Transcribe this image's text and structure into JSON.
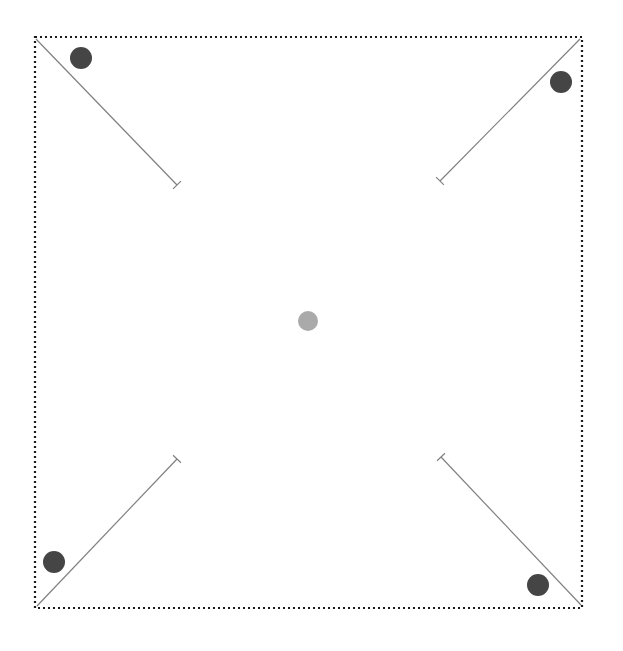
{
  "canvas": {
    "width": 623,
    "height": 651,
    "background": "#ffffff"
  },
  "boundary": {
    "name": "dotted-boundary-rectangle",
    "x": 35,
    "y": 37,
    "width": 547,
    "height": 571,
    "stroke": "#1a1a1a",
    "stroke_width": 2.2,
    "dash": "2 3",
    "style": "dotted"
  },
  "center_marker": {
    "name": "center-node",
    "cx": 308,
    "cy": 321,
    "r": 10,
    "fill": "#aaaaaa"
  },
  "corner_vectors": [
    {
      "name": "vector-top-left",
      "corner": "top-left",
      "x1": 36,
      "y1": 39,
      "x2": 177,
      "y2": 185,
      "stroke": "#808080",
      "stroke_width": 1.2,
      "cap": "perpendicular-tick",
      "cap_length": 11
    },
    {
      "name": "vector-top-right",
      "corner": "top-right",
      "x1": 580,
      "y1": 39,
      "x2": 440,
      "y2": 181,
      "stroke": "#808080",
      "stroke_width": 1.2,
      "cap": "perpendicular-tick",
      "cap_length": 11
    },
    {
      "name": "vector-bottom-left",
      "corner": "bottom-left",
      "x1": 37,
      "y1": 606,
      "x2": 177,
      "y2": 459,
      "stroke": "#808080",
      "stroke_width": 1.2,
      "cap": "perpendicular-tick",
      "cap_length": 11
    },
    {
      "name": "vector-bottom-right",
      "corner": "bottom-right",
      "x1": 581,
      "y1": 605,
      "x2": 441,
      "y2": 457,
      "stroke": "#808080",
      "stroke_width": 1.2,
      "cap": "perpendicular-tick",
      "cap_length": 11
    }
  ],
  "corner_nodes": [
    {
      "name": "node-top-left",
      "cx": 81,
      "cy": 58,
      "r": 11,
      "fill": "#454545"
    },
    {
      "name": "node-top-right",
      "cx": 561,
      "cy": 82,
      "r": 11,
      "fill": "#454545"
    },
    {
      "name": "node-bottom-left",
      "cx": 54,
      "cy": 562,
      "r": 11,
      "fill": "#454545"
    },
    {
      "name": "node-bottom-right",
      "cx": 538,
      "cy": 585,
      "r": 11,
      "fill": "#454545"
    }
  ]
}
